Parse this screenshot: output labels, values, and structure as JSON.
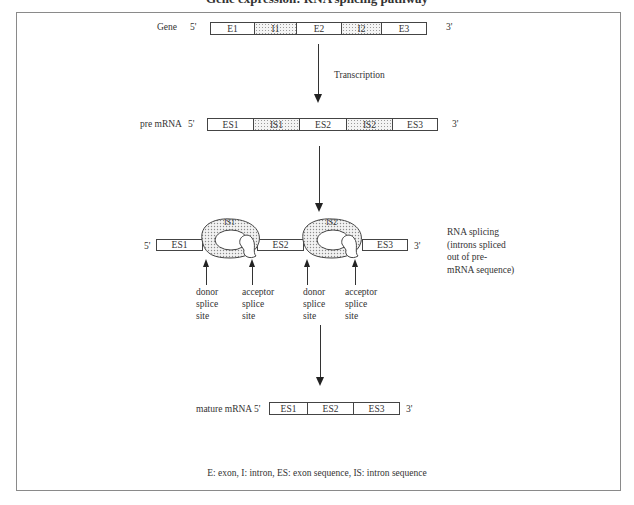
{
  "title_partial": "Gene expression: RNA splicing pathway",
  "gene_row": {
    "label": "Gene",
    "five_prime": "5'",
    "three_prime": "3'",
    "segments": [
      {
        "label": "E1",
        "type": "exon"
      },
      {
        "label": "I1",
        "type": "intron"
      },
      {
        "label": "E2",
        "type": "exon"
      },
      {
        "label": "I2",
        "type": "intron"
      },
      {
        "label": "E3",
        "type": "exon"
      }
    ]
  },
  "step1": {
    "label": "Transcription"
  },
  "pre_mrna_row": {
    "label": "pre mRNA",
    "five_prime": "5'",
    "three_prime": "3'",
    "segments": [
      {
        "label": "ES1",
        "type": "exon"
      },
      {
        "label": "IS1",
        "type": "intron"
      },
      {
        "label": "ES2",
        "type": "exon"
      },
      {
        "label": "IS2",
        "type": "intron"
      },
      {
        "label": "ES3",
        "type": "exon"
      }
    ]
  },
  "splicing_row": {
    "five_prime": "5'",
    "three_prime": "3'",
    "exons": [
      "ES1",
      "ES2",
      "ES3"
    ],
    "loops": [
      "IS1",
      "IS2"
    ],
    "sites": [
      {
        "line1": "donor",
        "line2": "splice",
        "line3": "site"
      },
      {
        "line1": "acceptor",
        "line2": "splice",
        "line3": "site"
      },
      {
        "line1": "donor",
        "line2": "splice",
        "line3": "site"
      },
      {
        "line1": "acceptor",
        "line2": "splice",
        "line3": "site"
      }
    ],
    "note": {
      "line1": "RNA splicing",
      "line2": "(introns spliced",
      "line3": "out of pre-",
      "line4": "mRNA sequence)"
    }
  },
  "mature_row": {
    "label": "mature mRNA",
    "five_prime": "5'",
    "three_prime": "3'",
    "segments": [
      {
        "label": "ES1",
        "type": "exon"
      },
      {
        "label": "ES2",
        "type": "exon"
      },
      {
        "label": "ES3",
        "type": "exon"
      }
    ]
  },
  "legend": "E: exon, I: intron, ES: exon sequence, IS: intron sequence",
  "colors": {
    "line": "#444444",
    "frame": "#8a8a8a",
    "intron_fill": "#d8d8d8"
  }
}
